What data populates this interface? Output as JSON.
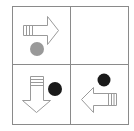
{
  "puzzle": {
    "grid": {
      "rows": 2,
      "cols": 2,
      "line_color": "#8a8a8a"
    },
    "cells": [
      {
        "position": "top-left",
        "arrow": "right",
        "dot": {
          "color": "#999999",
          "position": "below"
        }
      },
      {
        "position": "top-right",
        "arrow": null,
        "dot": null,
        "empty": true
      },
      {
        "position": "bottom-left",
        "arrow": "down",
        "dot": {
          "color": "#1a1a1a",
          "position": "right"
        }
      },
      {
        "position": "bottom-right",
        "arrow": "left",
        "dot": {
          "color": "#1a1a1a",
          "position": "above"
        }
      }
    ],
    "colors": {
      "arrow_stroke": "#9a9a9a",
      "arrow_fill": "#ffffff",
      "gray_dot": "#999999",
      "black_dot": "#1a1a1a"
    }
  }
}
